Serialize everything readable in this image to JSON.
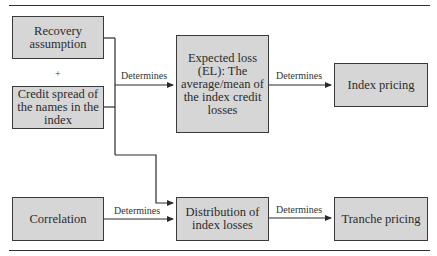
{
  "diagram": {
    "nodes": {
      "recovery": "Recovery assumption",
      "plus": "+",
      "credit_spread": "Credit spread of the names in the index",
      "expected_loss": "Expected loss (EL): The average/mean of the index credit losses",
      "index_pricing": "Index pricing",
      "correlation": "Correlation",
      "distribution": "Distribution of index losses",
      "tranche_pricing": "Tranche pricing"
    },
    "edges": {
      "inputs_to_el": "Determines",
      "el_to_index": "Determines",
      "correlation_to_distribution": "Determines",
      "distribution_to_tranche": "Determines"
    },
    "colors": {
      "box_fill": "#d6d6d6",
      "box_border": "#3a3a3a",
      "line": "#2a2a2a"
    }
  }
}
